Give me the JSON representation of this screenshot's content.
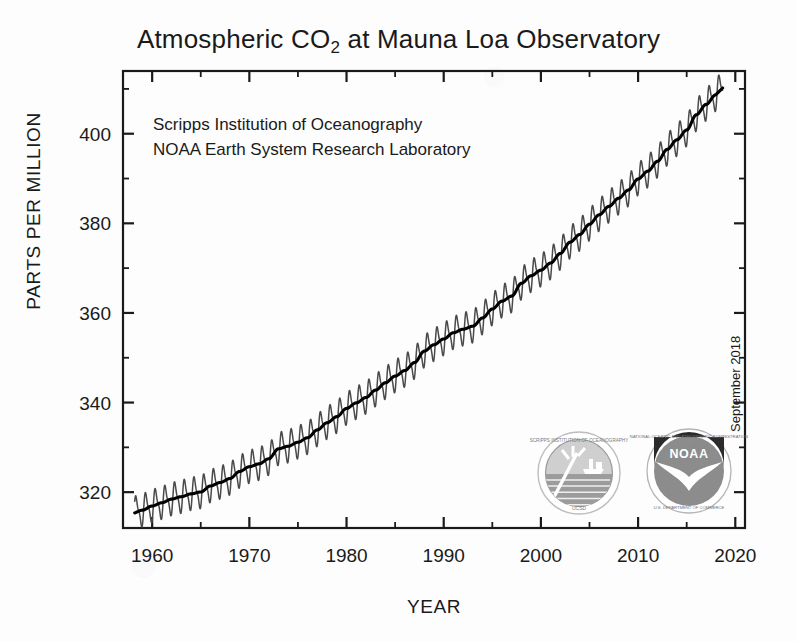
{
  "chart_data": {
    "type": "line",
    "title": "Atmospheric CO2 at Mauna Loa Observatory",
    "title_main": "Atmospheric CO",
    "title_sub": "2",
    "title_tail": " at Mauna Loa Observatory",
    "xlabel": "YEAR",
    "ylabel": "PARTS PER MILLION",
    "xlim": [
      1957,
      2021
    ],
    "ylim": [
      312,
      414
    ],
    "xticks": [
      1960,
      1970,
      1980,
      1990,
      2000,
      2010,
      2020
    ],
    "xticks_minor": [
      1965,
      1975,
      1985,
      1995,
      2005,
      2015
    ],
    "yticks": [
      320,
      340,
      360,
      380,
      400
    ],
    "yticks_minor": [
      330,
      350,
      370,
      390,
      410
    ],
    "grid": false,
    "legend": "none",
    "annotations": [
      "Scripps Institution of Oceanography",
      "NOAA Earth System Research Laboratory"
    ],
    "date_stamp": "September 2018",
    "series": [
      {
        "name": "Monthly mean CO2 (seasonal cycle)",
        "color": "#4a4a4a",
        "seasonal_amplitude_ppm": 3.2
      },
      {
        "name": "Smoothed trend (seasonally adjusted)",
        "color": "#000000"
      }
    ],
    "x": [
      1958,
      1959,
      1960,
      1961,
      1962,
      1963,
      1964,
      1965,
      1966,
      1967,
      1968,
      1969,
      1970,
      1971,
      1972,
      1973,
      1974,
      1975,
      1976,
      1977,
      1978,
      1979,
      1980,
      1981,
      1982,
      1983,
      1984,
      1985,
      1986,
      1987,
      1988,
      1989,
      1990,
      1991,
      1992,
      1993,
      1994,
      1995,
      1996,
      1997,
      1998,
      1999,
      2000,
      2001,
      2002,
      2003,
      2004,
      2005,
      2006,
      2007,
      2008,
      2009,
      2010,
      2011,
      2012,
      2013,
      2014,
      2015,
      2016,
      2017,
      2018
    ],
    "values": [
      315.3,
      315.98,
      316.91,
      317.64,
      318.45,
      318.99,
      319.62,
      320.04,
      321.38,
      322.16,
      323.04,
      324.62,
      325.68,
      326.32,
      327.45,
      329.68,
      330.25,
      331.15,
      332.15,
      333.9,
      335.5,
      336.85,
      338.69,
      339.93,
      341.13,
      342.78,
      344.42,
      345.9,
      347.15,
      348.93,
      351.48,
      352.91,
      354.19,
      355.59,
      356.37,
      357.04,
      358.89,
      360.88,
      362.64,
      363.76,
      366.63,
      368.31,
      369.55,
      371.14,
      373.28,
      375.8,
      377.52,
      379.8,
      381.9,
      383.79,
      385.6,
      387.43,
      389.9,
      391.65,
      393.85,
      396.52,
      398.65,
      400.83,
      404.24,
      406.55,
      408.7
    ],
    "start_value_ppm": 315.3,
    "end_value_ppm": 408.7
  },
  "logos": [
    {
      "name": "Scripps Institution of Oceanography seal",
      "short": "SCRIPPS",
      "ring_text": "SCRIPPS INSTITUTION OF OCEANOGRAPHY",
      "bottom_text": "UCSD"
    },
    {
      "name": "National Oceanic and Atmospheric Administration seal",
      "short": "NOAA",
      "ring_text_top": "NATIONAL OCEANIC AND ATMOSPHERIC ADMINISTRATION",
      "ring_text_bottom": "U.S. DEPARTMENT OF COMMERCE"
    }
  ],
  "colors": {
    "background": "#fdfdfd",
    "axis": "#1a1a1a",
    "seasonal_line": "#4a4a4a",
    "trend_line": "#000000",
    "logo_grey": "#8c8c8c",
    "logo_dark": "#2b2b2b"
  }
}
